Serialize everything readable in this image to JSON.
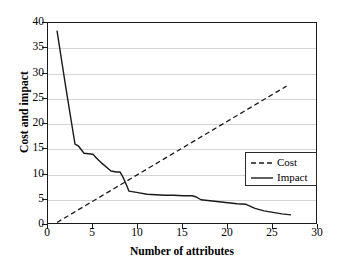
{
  "chart_data": {
    "type": "line",
    "title": "",
    "xlabel": "Number of attributes",
    "ylabel": "Cost and impact",
    "xlim": [
      0,
      30
    ],
    "ylim": [
      0,
      40
    ],
    "xticks": [
      "0",
      "5",
      "10",
      "15",
      "20",
      "25",
      "30"
    ],
    "yticks": [
      "0",
      "5",
      "10",
      "15",
      "20",
      "25",
      "30",
      "35",
      "40"
    ],
    "grid": "horizontal",
    "legend_position": "inside-right",
    "series": [
      {
        "name": "Cost",
        "style": "dashed",
        "color": "#1a1a1a",
        "x": [
          1,
          26.5
        ],
        "values": [
          0.5,
          27.5
        ]
      },
      {
        "name": "Impact",
        "style": "solid",
        "color": "#1a1a1a",
        "x": [
          1,
          2,
          3,
          3.4,
          4,
          5,
          5.4,
          6,
          7,
          7.6,
          8,
          8.3,
          8.7,
          9,
          10,
          11,
          12,
          13,
          14,
          15,
          16,
          16.4,
          17,
          18,
          19,
          20,
          21,
          22,
          23,
          24,
          25,
          26,
          27
        ],
        "values": [
          38.5,
          27.0,
          16.0,
          15.6,
          14.2,
          14.0,
          13.2,
          12.2,
          10.7,
          10.5,
          10.5,
          9.6,
          8.0,
          6.7,
          6.4,
          6.1,
          6.0,
          5.9,
          5.9,
          5.8,
          5.8,
          5.6,
          5.0,
          4.8,
          4.6,
          4.4,
          4.2,
          4.1,
          3.3,
          2.8,
          2.5,
          2.2,
          2.0
        ]
      }
    ]
  },
  "legend": {
    "entries": [
      {
        "label": "Cost"
      },
      {
        "label": "Impact"
      }
    ]
  }
}
